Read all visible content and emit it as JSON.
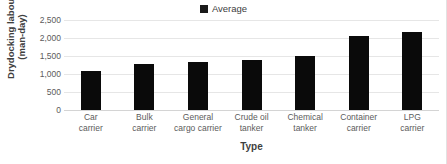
{
  "chart_data": {
    "type": "bar",
    "title": "",
    "xlabel": "Type",
    "ylabel_lines": [
      "Drydocking labour",
      "(man-day)"
    ],
    "ylabel": "Drydocking labour (man-day)",
    "legend": [
      {
        "name": "Average",
        "color": "#1a1a1a"
      }
    ],
    "legend_position": "top-center",
    "grid": true,
    "ylim": [
      0,
      2500
    ],
    "ytick_labels": [
      "2,500",
      "2,000",
      "1,500",
      "1,000",
      "500",
      "0"
    ],
    "yticks": [
      2500,
      2000,
      1500,
      1000,
      500,
      0
    ],
    "categories": [
      "Car carrier",
      "Bulk carrier",
      "General cargo carrier",
      "Crude oil tanker",
      "Chemical tanker",
      "Container carrier",
      "LPG carrier"
    ],
    "category_lines": [
      [
        "Car",
        "carrier"
      ],
      [
        "Bulk",
        "carrier"
      ],
      [
        "General",
        "cargo carrier"
      ],
      [
        "Crude oil",
        "tanker"
      ],
      [
        "Chemical",
        "tanker"
      ],
      [
        "Container",
        "carrier"
      ],
      [
        "LPG",
        "carrier"
      ]
    ],
    "series": [
      {
        "name": "Average",
        "values": [
          1090,
          1270,
          1330,
          1390,
          1510,
          2060,
          2170
        ]
      }
    ],
    "bar_color": "#0a0a0a"
  }
}
